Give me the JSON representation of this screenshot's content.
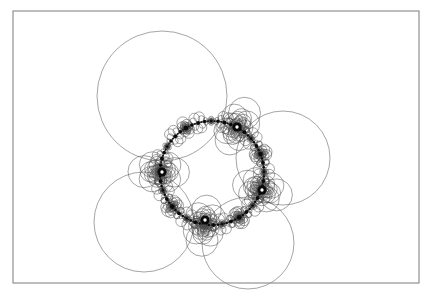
{
  "figure": {
    "canvas": {
      "width": 431,
      "height": 295,
      "background": "#ffffff"
    },
    "frame": {
      "name": "figure-border",
      "x": 13,
      "y": 11,
      "width": 406,
      "height": 272,
      "stroke": "#8d8d8d",
      "stroke_width": 1.15
    },
    "style": {
      "circle_stroke": "#4a4a4a",
      "circle_stroke_width": 0.5,
      "dot_fill": "#0a0a0a",
      "dot_core_fill": "#ffffff"
    }
  },
  "chart_data": {
    "type": "scatter",
    "xlabel": "",
    "ylabel": "",
    "xlim": [
      13,
      419
    ],
    "ylim": [
      11,
      283
    ],
    "grid": false,
    "legend": null,
    "base_circle": {
      "cx": 212,
      "cy": 173,
      "r": 52
    },
    "generations": 6,
    "cusp_count": 4,
    "chain_nodes": 24,
    "major_cusps": [
      {
        "label": "west-cusp",
        "x": 162,
        "y": 172,
        "radius": 4.6
      },
      {
        "label": "north-cusp",
        "x": 237,
        "y": 127,
        "radius": 4.6
      },
      {
        "label": "south-cusp",
        "x": 205,
        "y": 220,
        "radius": 4.6
      },
      {
        "label": "east-cusp",
        "x": 262,
        "y": 190,
        "radius": 4.6
      }
    ],
    "primary_circles": [
      {
        "label": "large-northwest",
        "cx": 162,
        "cy": 96,
        "r": 65
      },
      {
        "label": "large-east",
        "cx": 283,
        "cy": 158,
        "r": 47
      },
      {
        "label": "large-southwest",
        "cx": 144,
        "cy": 222,
        "r": 50
      },
      {
        "label": "large-southeast",
        "cx": 248,
        "cy": 243,
        "r": 46
      }
    ],
    "series": [
      {
        "name": "tangent-circle-family",
        "description": "Self-similar families of mutually tangent circles nested at each cusp of the invariant circle"
      }
    ]
  }
}
